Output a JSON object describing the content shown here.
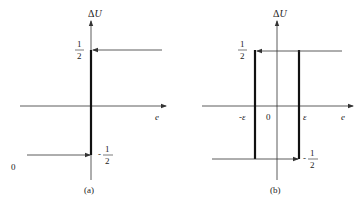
{
  "panels": [
    {
      "id": "a",
      "caption": "(a)",
      "y_axis_label": "ΔU",
      "x_axis_label": "e",
      "upper_level": {
        "num": "1",
        "den": "2"
      },
      "lower_level": {
        "sign": "-",
        "num": "1",
        "den": "2"
      },
      "origin_label": "0"
    },
    {
      "id": "b",
      "caption": "(b)",
      "y_axis_label": "ΔU",
      "x_axis_label": "e",
      "upper_level": {
        "num": "1",
        "den": "2"
      },
      "lower_level": {
        "sign": "-",
        "num": "1",
        "den": "2"
      },
      "origin_label": "0",
      "neg_threshold": "-ε",
      "pos_threshold": "ε"
    }
  ],
  "colors": {
    "line": "#333333",
    "thick": "#111111",
    "text": "#222222"
  }
}
